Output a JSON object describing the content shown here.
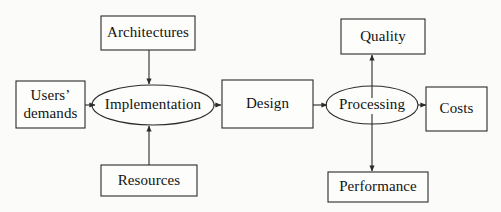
{
  "diagram": {
    "colors": {
      "background": "#fbfbf9",
      "stroke": "#2b2b2b",
      "text": "#131313"
    },
    "nodes": [
      {
        "id": "architectures",
        "label": "Architectures",
        "shape": "rect",
        "x": 101,
        "y": 16,
        "w": 94,
        "h": 34
      },
      {
        "id": "users-demands",
        "label": "Users’\ndemands",
        "shape": "rect",
        "x": 16,
        "y": 81,
        "w": 69,
        "h": 47
      },
      {
        "id": "implementation",
        "label": "Implementation",
        "shape": "ellipse",
        "x": 92,
        "y": 85,
        "w": 122,
        "h": 40
      },
      {
        "id": "resources",
        "label": "Resources",
        "shape": "rect",
        "x": 101,
        "y": 165,
        "w": 96,
        "h": 31
      },
      {
        "id": "design",
        "label": "Design",
        "shape": "rect",
        "x": 222,
        "y": 80,
        "w": 91,
        "h": 48
      },
      {
        "id": "quality",
        "label": "Quality",
        "shape": "rect",
        "x": 341,
        "y": 19,
        "w": 84,
        "h": 35
      },
      {
        "id": "processing",
        "label": "Processing",
        "shape": "ellipse",
        "x": 326,
        "y": 86,
        "w": 92,
        "h": 38
      },
      {
        "id": "costs",
        "label": "Costs",
        "shape": "rect",
        "x": 426,
        "y": 87,
        "w": 61,
        "h": 44
      },
      {
        "id": "performance",
        "label": "Performance",
        "shape": "rect",
        "x": 328,
        "y": 172,
        "w": 100,
        "h": 30
      }
    ],
    "edges": [
      {
        "id": "architectures-to-implementation",
        "from": "architectures",
        "to": "implementation",
        "direction": "down"
      },
      {
        "id": "users-demands-to-implementation",
        "from": "users-demands",
        "to": "implementation",
        "direction": "right"
      },
      {
        "id": "resources-to-implementation",
        "from": "resources",
        "to": "implementation",
        "direction": "up"
      },
      {
        "id": "implementation-to-design",
        "from": "implementation",
        "to": "design",
        "direction": "right"
      },
      {
        "id": "design-to-processing",
        "from": "design",
        "to": "processing",
        "direction": "right"
      },
      {
        "id": "processing-to-costs",
        "from": "processing",
        "to": "costs",
        "direction": "right"
      },
      {
        "id": "processing-to-quality",
        "from": "processing",
        "to": "quality",
        "direction": "up"
      },
      {
        "id": "processing-to-performance",
        "from": "processing",
        "to": "performance",
        "direction": "down"
      }
    ]
  }
}
